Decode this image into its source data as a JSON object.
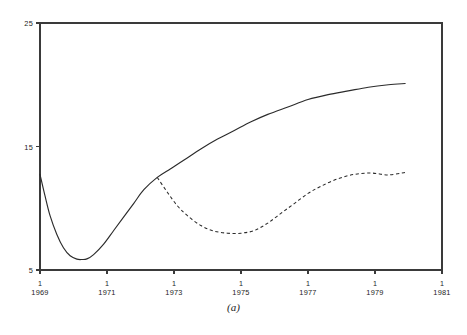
{
  "figure": {
    "caption": "(a)"
  },
  "chart_data": {
    "type": "line",
    "title": "",
    "subtitle": "",
    "xlabel": "",
    "ylabel": "",
    "xlim": [
      1969,
      1981
    ],
    "ylim": [
      5,
      25
    ],
    "grid": false,
    "legend_position": "none",
    "yticks": [
      5,
      15,
      25
    ],
    "ytick_labels": [
      "5",
      "15",
      "25"
    ],
    "xticks": [
      1969,
      1971,
      1973,
      1975,
      1977,
      1979,
      1981
    ],
    "xtick_quarter_labels": [
      "1",
      "1",
      "1",
      "1",
      "1",
      "1",
      "1"
    ],
    "xtick_year_labels": [
      "1969",
      "1971",
      "1973",
      "1975",
      "1977",
      "1979",
      "1981"
    ],
    "series": [
      {
        "name": "solid",
        "style": "solid",
        "color": "#2b2b2b",
        "x": [
          1969.0,
          1969.15,
          1969.3,
          1969.5,
          1969.7,
          1969.9,
          1970.1,
          1970.25,
          1970.4,
          1970.6,
          1970.9,
          1971.2,
          1971.5,
          1971.8,
          1972.1,
          1972.5,
          1972.9,
          1973.3,
          1973.8,
          1974.3,
          1974.8,
          1975.3,
          1975.8,
          1976.4,
          1977.0,
          1977.6,
          1978.2,
          1978.8,
          1979.4,
          1979.9
        ],
        "y": [
          12.75,
          11.0,
          9.4,
          7.9,
          6.8,
          6.15,
          5.88,
          5.85,
          5.9,
          6.25,
          7.1,
          8.2,
          9.3,
          10.4,
          11.5,
          12.5,
          13.2,
          13.9,
          14.8,
          15.6,
          16.3,
          17.0,
          17.6,
          18.2,
          18.8,
          19.2,
          19.5,
          19.8,
          20.0,
          20.1
        ]
      },
      {
        "name": "dashed",
        "style": "dashed",
        "color": "#2b2b2b",
        "x": [
          1972.5,
          1972.8,
          1973.1,
          1973.4,
          1973.8,
          1974.2,
          1974.6,
          1975.0,
          1975.4,
          1975.8,
          1976.2,
          1976.6,
          1977.0,
          1977.4,
          1977.9,
          1978.4,
          1978.9,
          1979.4,
          1979.9
        ],
        "y": [
          12.5,
          11.3,
          10.2,
          9.4,
          8.6,
          8.15,
          7.98,
          7.98,
          8.2,
          8.8,
          9.6,
          10.4,
          11.2,
          11.8,
          12.4,
          12.75,
          12.85,
          12.7,
          12.9
        ]
      }
    ]
  }
}
